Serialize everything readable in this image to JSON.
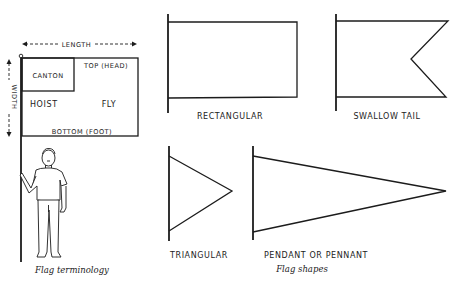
{
  "terminology": {
    "caption": "Flag terminology",
    "length_label": "LENGTH",
    "width_label": "WIDTH",
    "canton_label": "CANTON",
    "top_label": "TOP (HEAD)",
    "hoist_label": "HOIST",
    "fly_label": "FLY",
    "bottom_label": "BOTTOM (FOOT)"
  },
  "shapes": {
    "caption": "Flag shapes",
    "items": [
      {
        "label": "RECTANGULAR"
      },
      {
        "label": "SWALLOW TAIL"
      },
      {
        "label": "TRIANGULAR"
      },
      {
        "label": "PENDANT OR PENNANT"
      }
    ]
  },
  "colors": {
    "line": "#1c1c1c",
    "background": "#ffffff"
  }
}
